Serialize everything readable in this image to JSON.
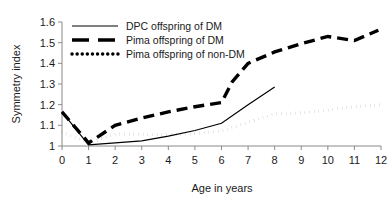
{
  "chart_data": {
    "type": "line",
    "title": "",
    "xlabel": "Age in years",
    "ylabel": "Symmetry index",
    "xlim": [
      0,
      12
    ],
    "ylim": [
      1,
      1.6
    ],
    "grid": false,
    "legend_position": "top-left-inside",
    "x_ticks": [
      "0",
      "1",
      "2",
      "3",
      "4",
      "5",
      "6",
      "7",
      "8",
      "9",
      "10",
      "11",
      "12"
    ],
    "y_ticks": [
      "1",
      "1.1",
      "1.2",
      "1.3",
      "1.4",
      "1.5",
      "1.6"
    ],
    "series": [
      {
        "name": "DPC offspring of DM",
        "style": "solid",
        "color": "#000000",
        "x": [
          0,
          1,
          2,
          3,
          4,
          5,
          6,
          7,
          8
        ],
        "values": [
          1.165,
          1.005,
          1.015,
          1.025,
          1.048,
          1.075,
          1.11,
          1.2,
          1.285
        ]
      },
      {
        "name": "Pima offspring of DM",
        "style": "dashed",
        "color": "#000000",
        "x": [
          0,
          1,
          2,
          3,
          4,
          5,
          6,
          6.4,
          7,
          8,
          9,
          10,
          11,
          11.9
        ],
        "values": [
          1.165,
          1.015,
          1.1,
          1.135,
          1.165,
          1.19,
          1.21,
          1.31,
          1.4,
          1.455,
          1.495,
          1.53,
          1.51,
          1.56
        ]
      },
      {
        "name": "Pima offspring of non-DM",
        "style": "dotted",
        "color": "#000000",
        "x": [
          0,
          1,
          2,
          3,
          4,
          5,
          6,
          7,
          8,
          9,
          10,
          11,
          12
        ],
        "values": [
          1.067,
          1.015,
          1.057,
          1.057,
          1.055,
          1.06,
          1.072,
          1.115,
          1.155,
          1.16,
          1.175,
          1.19,
          1.2
        ]
      }
    ]
  }
}
